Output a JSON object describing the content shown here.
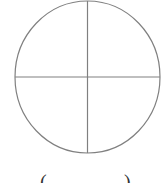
{
  "figure": {
    "shape": "circle divided into four quadrants",
    "stroke_color": "#808080",
    "background_color": "#ffffff",
    "circle": {
      "cx": 87.5,
      "cy": 77,
      "rx": 72.5,
      "ry": 76
    },
    "horizontal_divider": {
      "x1": 15,
      "y1": 77,
      "x2": 160,
      "y2": 77
    },
    "vertical_divider": {
      "x1": 87.5,
      "y1": 1,
      "x2": 87.5,
      "y2": 153
    }
  },
  "caption": {
    "open_paren": "(",
    "close_paren": ")"
  }
}
